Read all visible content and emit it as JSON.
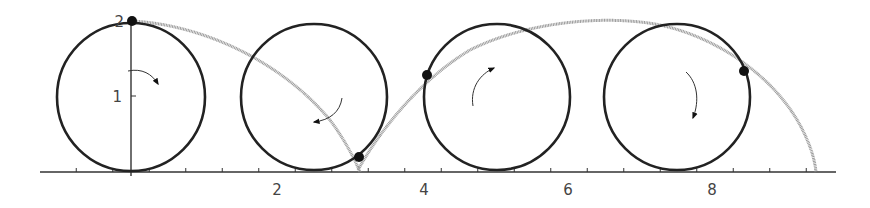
{
  "figure": {
    "type": "diagram",
    "x_axis": {
      "tick_labels": [
        "2",
        "4",
        "6",
        "8"
      ],
      "tick_values": [
        2,
        4,
        6,
        8
      ],
      "minor_tick_step": 0.5,
      "range": [
        -1.25,
        9.75
      ]
    },
    "y_axis": {
      "tick_labels": [
        "1",
        "2"
      ],
      "tick_values": [
        1,
        2
      ]
    },
    "circles": [
      {
        "cx": 0,
        "cy": 1,
        "r": 1,
        "arrow": "clockwise"
      },
      {
        "cx": 2.5,
        "cy": 1,
        "r": 1,
        "arrow": "clockwise"
      },
      {
        "cx": 5.0,
        "cy": 1,
        "r": 1,
        "arrow": "counterclockwise"
      },
      {
        "cx": 7.5,
        "cy": 1,
        "r": 1,
        "arrow": "clockwise"
      }
    ],
    "points": [
      {
        "x": 0,
        "y": 2
      },
      {
        "x": 3.12,
        "y": 0.2
      },
      {
        "x": 4.02,
        "y": 1.3
      },
      {
        "x": 8.45,
        "y": 1.4
      }
    ],
    "colors": {
      "circle": "#222222",
      "curve": "#9a9a9a",
      "axis": "#333333",
      "point": "#111111"
    }
  }
}
